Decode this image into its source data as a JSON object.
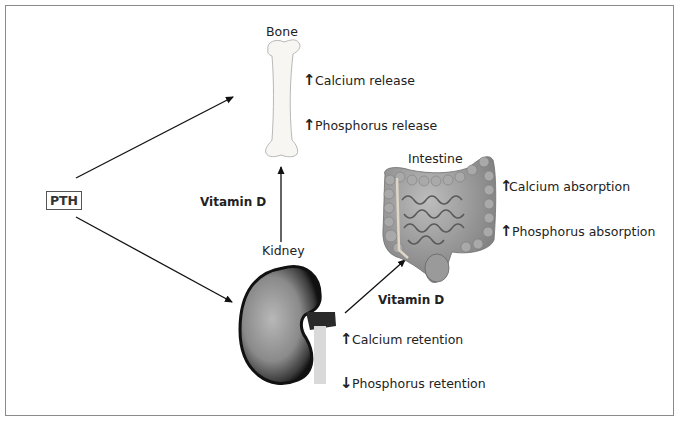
{
  "diagram": {
    "hormone": "PTH",
    "organs": {
      "bone": {
        "label": "Bone",
        "effects": [
          {
            "direction": "up",
            "symbol": "↑",
            "text": "Calcium release"
          },
          {
            "direction": "up",
            "symbol": "↑",
            "text": "Phosphorus release"
          }
        ]
      },
      "intestine": {
        "label": "Intestine",
        "effects": [
          {
            "direction": "up",
            "symbol": "↑",
            "text": "Calcium absorption"
          },
          {
            "direction": "up",
            "symbol": "↑",
            "text": "Phosphorus absorption"
          }
        ]
      },
      "kidney": {
        "label": "Kidney",
        "effects": [
          {
            "direction": "up",
            "symbol": "↑",
            "text": "Calcium retention"
          },
          {
            "direction": "down",
            "symbol": "↓",
            "text": "Phosphorus retention"
          }
        ]
      }
    },
    "edges": [
      {
        "from": "PTH",
        "to": "Bone",
        "label": ""
      },
      {
        "from": "PTH",
        "to": "Kidney",
        "label": ""
      },
      {
        "from": "Kidney",
        "to": "Bone",
        "label": "Vitamin D"
      },
      {
        "from": "Kidney",
        "to": "Intestine",
        "label": "Vitamin D"
      }
    ],
    "edge_labels": {
      "kidney_to_bone": "Vitamin D",
      "kidney_to_intestine": "Vitamin D"
    }
  }
}
